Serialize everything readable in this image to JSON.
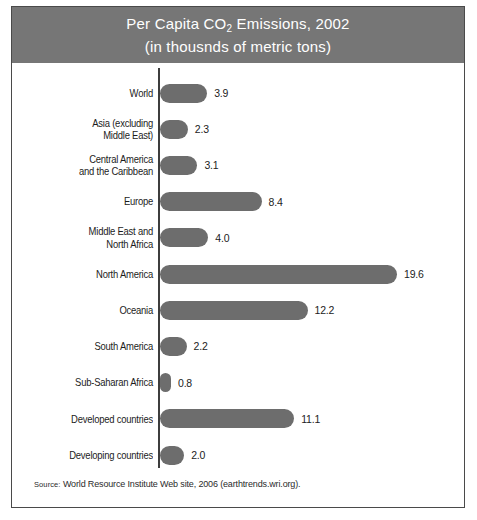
{
  "figure": {
    "title_line_1_prefix": "Per Capita CO",
    "title_line_1_sub": "2",
    "title_line_1_suffix": " Emissions, 2002",
    "title_line_2": "(in thousnds of metric tons)",
    "source_prefix": "Source:",
    "source_text": " World Resource Institute Web site, 2006 (earthtrends.wri.org).",
    "header_color": "#767676",
    "bar_color": "#6d6d6d",
    "axis_color": "#3d3d3d",
    "border_color": "#4a4a4a",
    "title_color": "#ffffff"
  },
  "chart_data": {
    "type": "bar",
    "orientation": "horizontal",
    "title": "Per Capita CO2 Emissions, 2002 (in thousnds of metric tons)",
    "xlabel": "",
    "ylabel": "",
    "xlim": [
      0,
      19.6
    ],
    "grid": false,
    "legend": false,
    "categories": [
      "World",
      "Asia (excluding\nMiddle East)",
      "Central America\nand the Caribbean",
      "Europe",
      "Middle East and\nNorth Africa",
      "North America",
      "Oceania",
      "South America",
      "Sub-Saharan Africa",
      "Developed countries",
      "Developing countries"
    ],
    "values": [
      3.9,
      2.3,
      3.1,
      8.4,
      4.0,
      19.6,
      12.2,
      2.2,
      0.8,
      11.1,
      2.0
    ],
    "value_labels": [
      "3.9",
      "2.3",
      "3.1",
      "8.4",
      "4.0",
      "19.6",
      "12.2",
      "2.2",
      "0.8",
      "11.1",
      "2.0"
    ],
    "series": [
      {
        "name": "Per capita CO2 emissions",
        "values": [
          3.9,
          2.3,
          3.1,
          8.4,
          4.0,
          19.6,
          12.2,
          2.2,
          0.8,
          11.1,
          2.0
        ]
      }
    ]
  }
}
